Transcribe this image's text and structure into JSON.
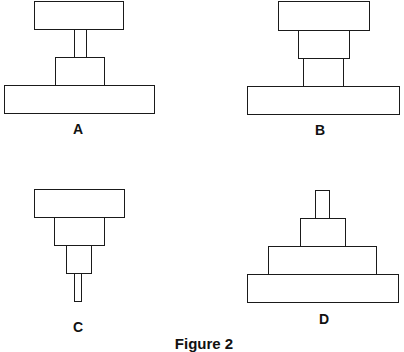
{
  "figure": {
    "caption": "Figure 2",
    "stroke_color": "#1a1a1a",
    "background": "#ffffff"
  },
  "diagrams": [
    {
      "label": "A",
      "description": "Wide top block on narrow stem, resting on medium block over wide base",
      "parts": [
        "top-block",
        "stem",
        "middle-block",
        "base-block"
      ]
    },
    {
      "label": "B",
      "description": "Wide top block over medium block over narrower block on wide base",
      "parts": [
        "top-block",
        "upper-middle-block",
        "lower-middle-block",
        "base-block"
      ]
    },
    {
      "label": "C",
      "description": "Inverted stepped stack: wide top, medium, narrow, thin stem at bottom",
      "parts": [
        "top-block",
        "middle-block",
        "narrow-block",
        "stem"
      ]
    },
    {
      "label": "D",
      "description": "Stepped pyramid: thin stem on top, small, medium, wide base",
      "parts": [
        "stem",
        "small-block",
        "medium-block",
        "base-block"
      ]
    }
  ]
}
